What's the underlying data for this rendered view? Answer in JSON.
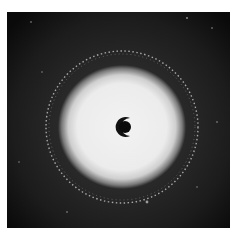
{
  "image": {
    "subject": "diffraction pattern",
    "description": "Circular diffraction pattern with bright central halo, speckled outer ring, and dark beam stop at center",
    "colors": {
      "background": "#0c0c0c",
      "halo": "#efefef",
      "ring": "#d8d8d8",
      "beam_stop": "#0a0a0a",
      "page": "#ffffff"
    }
  }
}
